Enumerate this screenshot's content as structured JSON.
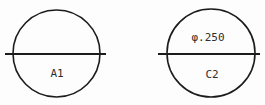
{
  "diagram": {
    "background_color": "#fdfdfd",
    "line_color": "#1c1c1c",
    "text_color": "#2e2e2e",
    "circles": [
      {
        "id": "left",
        "label": "A1",
        "dimension_label": ""
      },
      {
        "id": "right",
        "label": "C2",
        "dimension_label": "φ.250"
      }
    ]
  }
}
